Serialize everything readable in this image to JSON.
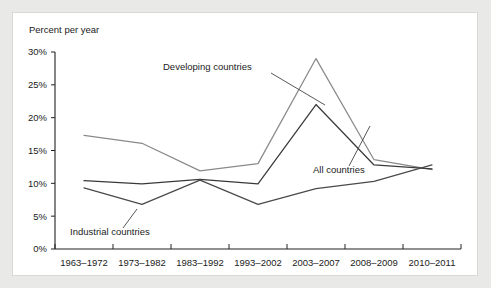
{
  "figure": {
    "background_color": "#e9e9e7",
    "panel_color": "#ffffff"
  },
  "chart_data": {
    "type": "line",
    "title": "",
    "subtitle": "",
    "xlabel": "",
    "ylabel": "Percent per year",
    "ylim": [
      0,
      30
    ],
    "ytick_labels": [
      "0%",
      "5%",
      "10%",
      "15%",
      "20%",
      "25%",
      "30%"
    ],
    "ytick_values": [
      0,
      5,
      10,
      15,
      20,
      25,
      30
    ],
    "grid": false,
    "legend_position": "inline-annotations",
    "categories": [
      "1963–1972",
      "1973–1982",
      "1983–1992",
      "1993–2002",
      "2003–2007",
      "2008–2009",
      "2010–2011"
    ],
    "series": [
      {
        "name": "Developing countries",
        "color": "#8a8a8a",
        "values": [
          17.3,
          16.1,
          11.9,
          13.0,
          29.0,
          13.6,
          12.1
        ]
      },
      {
        "name": "All countries",
        "color": "#3a3a3a",
        "values": [
          10.4,
          9.9,
          10.6,
          9.9,
          22.0,
          12.8,
          12.2
        ]
      },
      {
        "name": "Industrial countries",
        "color": "#4a4a4a",
        "values": [
          9.3,
          6.8,
          10.5,
          6.8,
          9.2,
          10.3,
          12.8
        ]
      }
    ],
    "annotations": [
      {
        "text": "Developing countries",
        "target_category": "2003–2007",
        "target_value": 25.0
      },
      {
        "text": "All countries",
        "target_category": "2003–2007",
        "target_value": 19.0
      },
      {
        "text": "Industrial countries",
        "target_category": "1973–1982",
        "target_value": 6.8
      }
    ]
  }
}
